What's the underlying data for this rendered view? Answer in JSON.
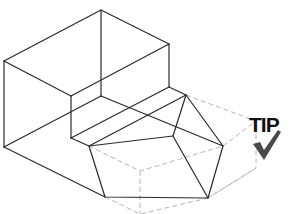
{
  "figure": {
    "colors": {
      "solid_line": "#2a2a2a",
      "hidden_line": "#b5b5b5",
      "background": "#ffffff",
      "tip": "#111111",
      "check": "#4a4a4a"
    }
  },
  "badge": {
    "label": "TIP",
    "icon": "checkmark-icon"
  }
}
